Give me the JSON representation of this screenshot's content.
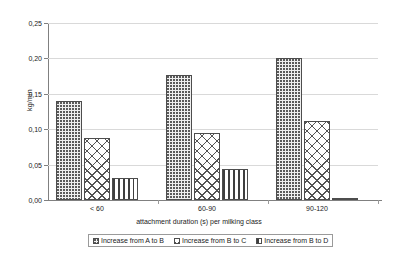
{
  "chart_data": {
    "type": "bar",
    "title": "",
    "xlabel": "attachment duration (s) per milking class",
    "ylabel": "kg/min",
    "categories": [
      "< 60",
      "60-90",
      "90-120"
    ],
    "ylim": [
      0,
      0.25
    ],
    "ytick_labels": [
      "0,00",
      "0,05",
      "0,10",
      "0,15",
      "0,20",
      "0,25"
    ],
    "ytick_values": [
      0,
      0.05,
      0.1,
      0.15,
      0.2,
      0.25
    ],
    "grid": true,
    "legend_position": "bottom",
    "series": [
      {
        "name": "Increase from A to B",
        "pattern": "dots",
        "values": [
          0.14,
          0.177,
          0.2
        ]
      },
      {
        "name": "Increase from B to C",
        "pattern": "cross-hatch",
        "values": [
          0.088,
          0.095,
          0.112
        ]
      },
      {
        "name": "Increase from B to D",
        "pattern": "vertical-lines",
        "values": [
          0.031,
          0.044,
          0.001
        ]
      }
    ]
  },
  "colors": {
    "grid": "#d9d9d9",
    "axis": "#808080",
    "bar_outline": "#4d4d4d",
    "text": "#1a1a1a",
    "background": "#ffffff"
  }
}
